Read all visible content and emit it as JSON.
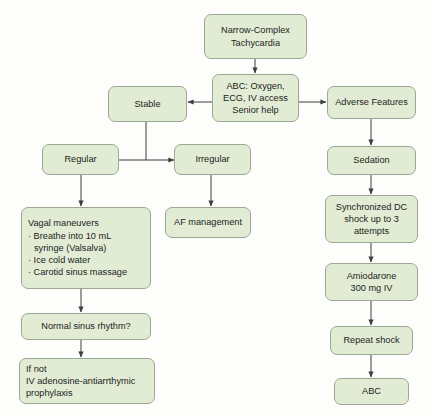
{
  "diagram": {
    "colors": {
      "node_fill": "#e2ecd4",
      "node_border": "#9aa894",
      "connector": "#3d3d3d",
      "background": "#fdfdfb",
      "text": "#1c1c1c"
    }
  },
  "nodes": {
    "narrow_complex_tachycardia": {
      "line1": "Narrow-Complex",
      "line2": "Tachycardia"
    },
    "abc_initial": {
      "line1": "ABC: Oxygen,",
      "line2": "ECG, IV access",
      "line3": "Senior help"
    },
    "stable": {
      "label": "Stable"
    },
    "adverse_features": {
      "label": "Adverse Features"
    },
    "regular": {
      "label": "Regular"
    },
    "irregular": {
      "label": "Irregular"
    },
    "af_management": {
      "label": "AF management"
    },
    "vagal_maneuvers": {
      "heading": "Vagal maneuvers",
      "bullet1": "· Breathe into 10 mL",
      "bullet1_cont": "syringe (Valsalva)",
      "bullet2": "· Ice cold water",
      "bullet3": "· Carotid sinus massage"
    },
    "normal_sinus_rhythm": {
      "label": "Normal sinus rhythm?"
    },
    "if_not_adenosine": {
      "line1": "If not",
      "line2": "IV adenosine-antiarrthymic",
      "line3": "prophylaxis"
    },
    "sedation": {
      "label": "Sedation"
    },
    "synchronized_dc_shock": {
      "line1": "Synchronized DC",
      "line2": "shock up to 3",
      "line3": "attempts"
    },
    "amiodarone": {
      "line1": "Amiodarone",
      "line2": "300 mg IV"
    },
    "repeat_shock": {
      "label": "Repeat shock"
    },
    "abc_final": {
      "label": "ABC"
    }
  }
}
